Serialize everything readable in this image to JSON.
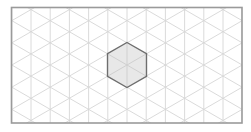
{
  "diagram": {
    "type": "isometric-triangular-grid",
    "frame": {
      "x": 11.5,
      "y": 7.5,
      "width": 230.5,
      "height": 115.5,
      "stroke": "#9a9a9a",
      "stroke_width": 1.6
    },
    "grid": {
      "origin_x": 127,
      "origin_y": 65,
      "spacing": 19.2,
      "stroke": "#d6d6d6",
      "stroke_width": 0.9
    },
    "hexagon": {
      "center_x": 127,
      "center_y": 65,
      "radius": 22.5,
      "fill": "#e8e8e8",
      "stroke": "#6e6e6e",
      "stroke_width": 1.4,
      "inner_lines_stroke": "#d0d0d0"
    }
  }
}
